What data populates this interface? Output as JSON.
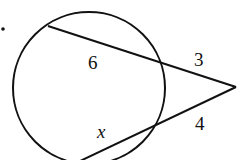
{
  "diagram": {
    "type": "intersecting secants",
    "stroke_color": "#111111",
    "background": "#ffffff",
    "labels": {
      "inner_top": "6",
      "outer_top": "3",
      "inner_bottom": "x",
      "outer_bottom": "4"
    }
  }
}
